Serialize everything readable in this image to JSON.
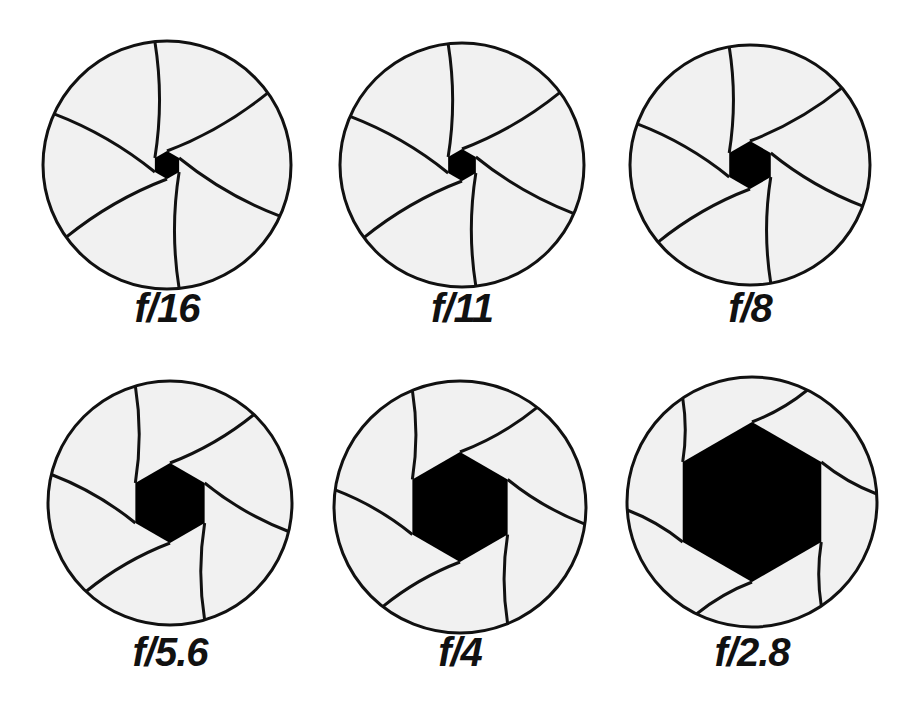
{
  "diagram": {
    "colors": {
      "background": "#ffffff",
      "blade_fill": "#f1f1f1",
      "outline": "#111111",
      "opening": "#000000"
    },
    "apertures": [
      {
        "label": "f/16",
        "cx": 167,
        "cy": 165,
        "r": 124,
        "hole": 14,
        "label_y": 288
      },
      {
        "label": "f/11",
        "cx": 462,
        "cy": 165,
        "r": 122,
        "hole": 16,
        "label_y": 288
      },
      {
        "label": "f/8",
        "cx": 750,
        "cy": 165,
        "r": 120,
        "hole": 24,
        "label_y": 288
      },
      {
        "label": "f/5.6",
        "cx": 170,
        "cy": 503,
        "r": 122,
        "hole": 40,
        "label_y": 632
      },
      {
        "label": "f/4",
        "cx": 460,
        "cy": 507,
        "r": 126,
        "hole": 55,
        "label_y": 632
      },
      {
        "label": "f/2.8",
        "cx": 752,
        "cy": 502,
        "r": 125,
        "hole": 80,
        "label_y": 632
      }
    ]
  }
}
